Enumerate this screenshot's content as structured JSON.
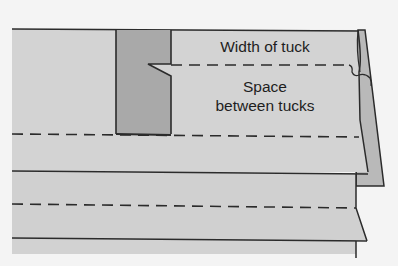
{
  "diagram": {
    "labels": {
      "width_of_tuck": "Width of tuck",
      "space_line1": "Space",
      "space_line2": "between tucks"
    },
    "colors": {
      "background": "#f4f4f4",
      "fabric": "#d3d3d3",
      "tuck_fold": "#a9a9a9",
      "fold_edge_underlay": "#b8b8b8",
      "line": "#2b2b2b"
    },
    "elements": [
      "fabric-panel",
      "tuck-strip",
      "stitch-line-top",
      "stitch-line-middle",
      "stitch-line-lower",
      "fold-line-1",
      "fold-line-2",
      "thread-end"
    ]
  }
}
